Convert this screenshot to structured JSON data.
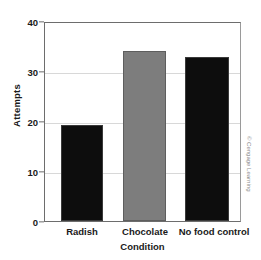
{
  "chart_data": {
    "type": "bar",
    "title": "",
    "categories": [
      "Radish",
      "Chocolate",
      "No food control"
    ],
    "values": [
      19.3,
      34.1,
      32.8
    ],
    "series": [
      {
        "name": "Attempts",
        "values": [
          19.3,
          34.1,
          32.8
        ]
      }
    ],
    "xlabel": "Condition",
    "ylabel": "Attempts",
    "ylim": [
      0,
      40
    ],
    "yticks": [
      0,
      10,
      20,
      30,
      40
    ],
    "ytick_labels": [
      "0",
      "10",
      "20",
      "30",
      "40"
    ],
    "gridlines": true,
    "grid_axis": "y",
    "legend": false,
    "bar_colors": [
      "#0d0d0d",
      "#7d7d7d",
      "#0d0d0d"
    ]
  },
  "axes": {
    "y_title": "Attempts",
    "x_title": "Condition",
    "y_ticks": [
      {
        "label": "40",
        "value": 40
      },
      {
        "label": "30",
        "value": 30
      },
      {
        "label": "20",
        "value": 20
      },
      {
        "label": "10",
        "value": 10
      },
      {
        "label": "0",
        "value": 0
      }
    ],
    "x_ticks": [
      {
        "label": "Radish"
      },
      {
        "label": "Chocolate"
      },
      {
        "label": "No food control"
      }
    ]
  },
  "credit": {
    "text": "© Cengage Learning"
  },
  "colors": {
    "bar_dark": "#0d0d0d",
    "bar_gray": "#7d7d7d",
    "axis": "#6d6d6d",
    "grid": "#d8d8d8",
    "text": "#1a1a1a"
  }
}
